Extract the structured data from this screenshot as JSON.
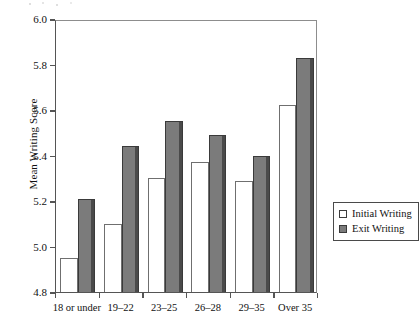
{
  "chart_data": {
    "type": "bar",
    "title": "",
    "xlabel": "",
    "ylabel": "Mean Writing Score",
    "ylim": [
      4.8,
      6.0
    ],
    "ytick_labels": [
      "6.0",
      "5.8",
      "5.6",
      "5.4",
      "5.2",
      "5.0",
      "4.8"
    ],
    "yticks": [
      6.0,
      5.8,
      5.6,
      5.4,
      5.2,
      5.0,
      4.8
    ],
    "grid": false,
    "legend_position": "right-inside-lower",
    "categories": [
      "18 or under",
      "19–22",
      "23–25",
      "26–28",
      "29–35",
      "Over 35"
    ],
    "series": [
      {
        "name": "Initial Writing",
        "color": "#ffffff",
        "edge_color": "#6f6f6f",
        "values": [
          4.95,
          5.1,
          5.3,
          5.37,
          5.29,
          5.62
        ]
      },
      {
        "name": "Exit Writing",
        "color": "#7b7b7b",
        "edge_color": "#3a3a3a",
        "values": [
          5.21,
          5.44,
          5.55,
          5.49,
          5.4,
          5.83
        ]
      }
    ]
  },
  "legend": {
    "items": [
      {
        "label": "Initial Writing",
        "swatch": "open-square-swatch"
      },
      {
        "label": "Exit Writing",
        "swatch": "filled-square-swatch"
      }
    ]
  }
}
